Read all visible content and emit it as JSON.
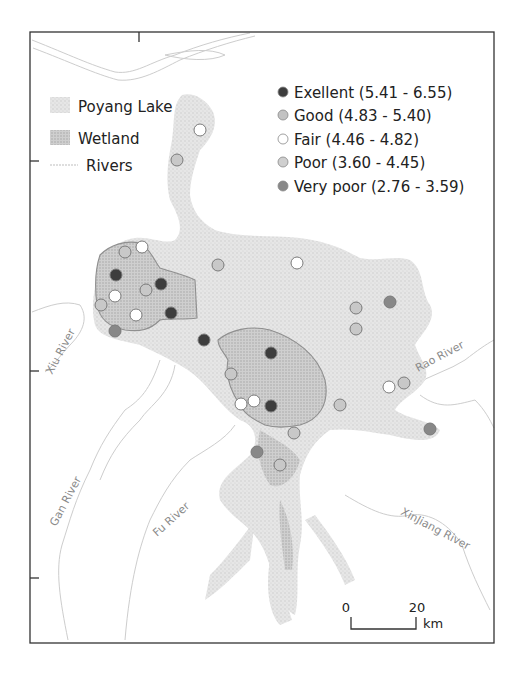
{
  "map": {
    "frame": {
      "left": 30,
      "top": 32,
      "right": 494,
      "bottom": 643
    },
    "colors": {
      "lake": "#dcdcdc",
      "wetland": "#c4c4c4",
      "river": "#c9c9c9",
      "boundary": "#8f8f8f",
      "frame": "#333333"
    }
  },
  "legend_layers": {
    "items": [
      {
        "label": "Poyang Lake",
        "symbol": "lake-swatch"
      },
      {
        "label": "Wetland",
        "symbol": "wetland-swatch"
      },
      {
        "label": "Rivers",
        "symbol": "river-line"
      }
    ]
  },
  "legend_classes": {
    "items": [
      {
        "label": "Exellent (5.41 - 6.55)",
        "class": "excellent",
        "color": "#3d3d3d"
      },
      {
        "label": "Good (4.83 - 5.40)",
        "class": "good",
        "color": "#c2c2c2"
      },
      {
        "label": "Fair (4.46 - 4.82)",
        "class": "fair",
        "color": "#ffffff"
      },
      {
        "label": "Poor (3.60 - 4.45)",
        "class": "poor",
        "color": "#c8c8c8"
      },
      {
        "label": "Very poor (2.76 - 3.59)",
        "class": "very-poor",
        "color": "#888888"
      }
    ]
  },
  "rivers": {
    "xiu": "Xiu River",
    "gan": "Gan River",
    "fu": "Fu River",
    "xinjiang": "XinJiang River",
    "rao": "Rao River"
  },
  "scale_bar": {
    "start": "0",
    "end": "20",
    "unit": "km"
  },
  "sites": [
    {
      "x": 200,
      "y": 130,
      "class": "fair"
    },
    {
      "x": 177,
      "y": 160,
      "class": "poor"
    },
    {
      "x": 125,
      "y": 252,
      "class": "poor"
    },
    {
      "x": 142,
      "y": 247,
      "class": "fair"
    },
    {
      "x": 116,
      "y": 275,
      "class": "excellent"
    },
    {
      "x": 161,
      "y": 284,
      "class": "excellent"
    },
    {
      "x": 146,
      "y": 290,
      "class": "poor"
    },
    {
      "x": 115,
      "y": 296,
      "class": "fair"
    },
    {
      "x": 101,
      "y": 305,
      "class": "poor"
    },
    {
      "x": 136,
      "y": 315,
      "class": "fair"
    },
    {
      "x": 171,
      "y": 313,
      "class": "excellent"
    },
    {
      "x": 115,
      "y": 331,
      "class": "very-poor"
    },
    {
      "x": 218,
      "y": 265,
      "class": "poor"
    },
    {
      "x": 297,
      "y": 263,
      "class": "fair"
    },
    {
      "x": 204,
      "y": 340,
      "class": "excellent"
    },
    {
      "x": 271,
      "y": 353,
      "class": "excellent"
    },
    {
      "x": 231,
      "y": 374,
      "class": "poor"
    },
    {
      "x": 241,
      "y": 404,
      "class": "fair"
    },
    {
      "x": 254,
      "y": 401,
      "class": "fair"
    },
    {
      "x": 271,
      "y": 406,
      "class": "excellent"
    },
    {
      "x": 356,
      "y": 308,
      "class": "poor"
    },
    {
      "x": 390,
      "y": 302,
      "class": "very-poor"
    },
    {
      "x": 356,
      "y": 329,
      "class": "poor"
    },
    {
      "x": 389,
      "y": 387,
      "class": "fair"
    },
    {
      "x": 404,
      "y": 383,
      "class": "poor"
    },
    {
      "x": 340,
      "y": 405,
      "class": "poor"
    },
    {
      "x": 294,
      "y": 433,
      "class": "poor"
    },
    {
      "x": 257,
      "y": 452,
      "class": "very-poor"
    },
    {
      "x": 280,
      "y": 465,
      "class": "poor"
    },
    {
      "x": 430,
      "y": 429,
      "class": "very-poor"
    }
  ]
}
